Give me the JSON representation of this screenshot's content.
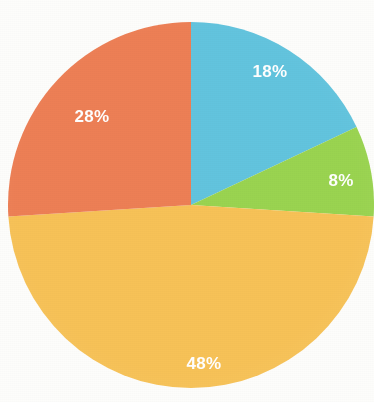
{
  "chart_data": {
    "type": "pie",
    "title": "",
    "subtitle": "",
    "xlabel": "",
    "ylabel": "",
    "legend": "none",
    "grid": false,
    "start_angle_deg": 0,
    "direction": "clockwise",
    "categories": [
      "Segment 1",
      "Segment 2",
      "Segment 3",
      "Segment 4"
    ],
    "values": [
      18,
      8,
      48,
      28
    ],
    "value_suffix": "%",
    "data_labels": [
      "18%",
      "8%",
      "48%",
      "28%"
    ],
    "colors": [
      "#62C4DE",
      "#9AD450",
      "#F7C257",
      "#ED7F55"
    ],
    "label_color": "#FFFFFF",
    "total": 100,
    "slices": [
      {
        "label": "18%",
        "value": 18,
        "color": "#62C4DE",
        "start_deg": 0,
        "end_deg": 64.8,
        "label_x": 270,
        "label_y": 77
      },
      {
        "label": "8%",
        "value": 8,
        "color": "#9AD450",
        "start_deg": 64.8,
        "end_deg": 93.6,
        "label_x": 341,
        "label_y": 186
      },
      {
        "label": "48%",
        "value": 48,
        "color": "#F7C257",
        "start_deg": 93.6,
        "end_deg": 266.4,
        "label_x": 204,
        "label_y": 369
      },
      {
        "label": "28%",
        "value": 28,
        "color": "#ED7F55",
        "start_deg": 266.4,
        "end_deg": 360,
        "label_x": 92,
        "label_y": 122
      }
    ],
    "geometry": {
      "center_x": 191,
      "center_y": 205,
      "radius": 183
    },
    "background_color": "#FDFDFB"
  }
}
